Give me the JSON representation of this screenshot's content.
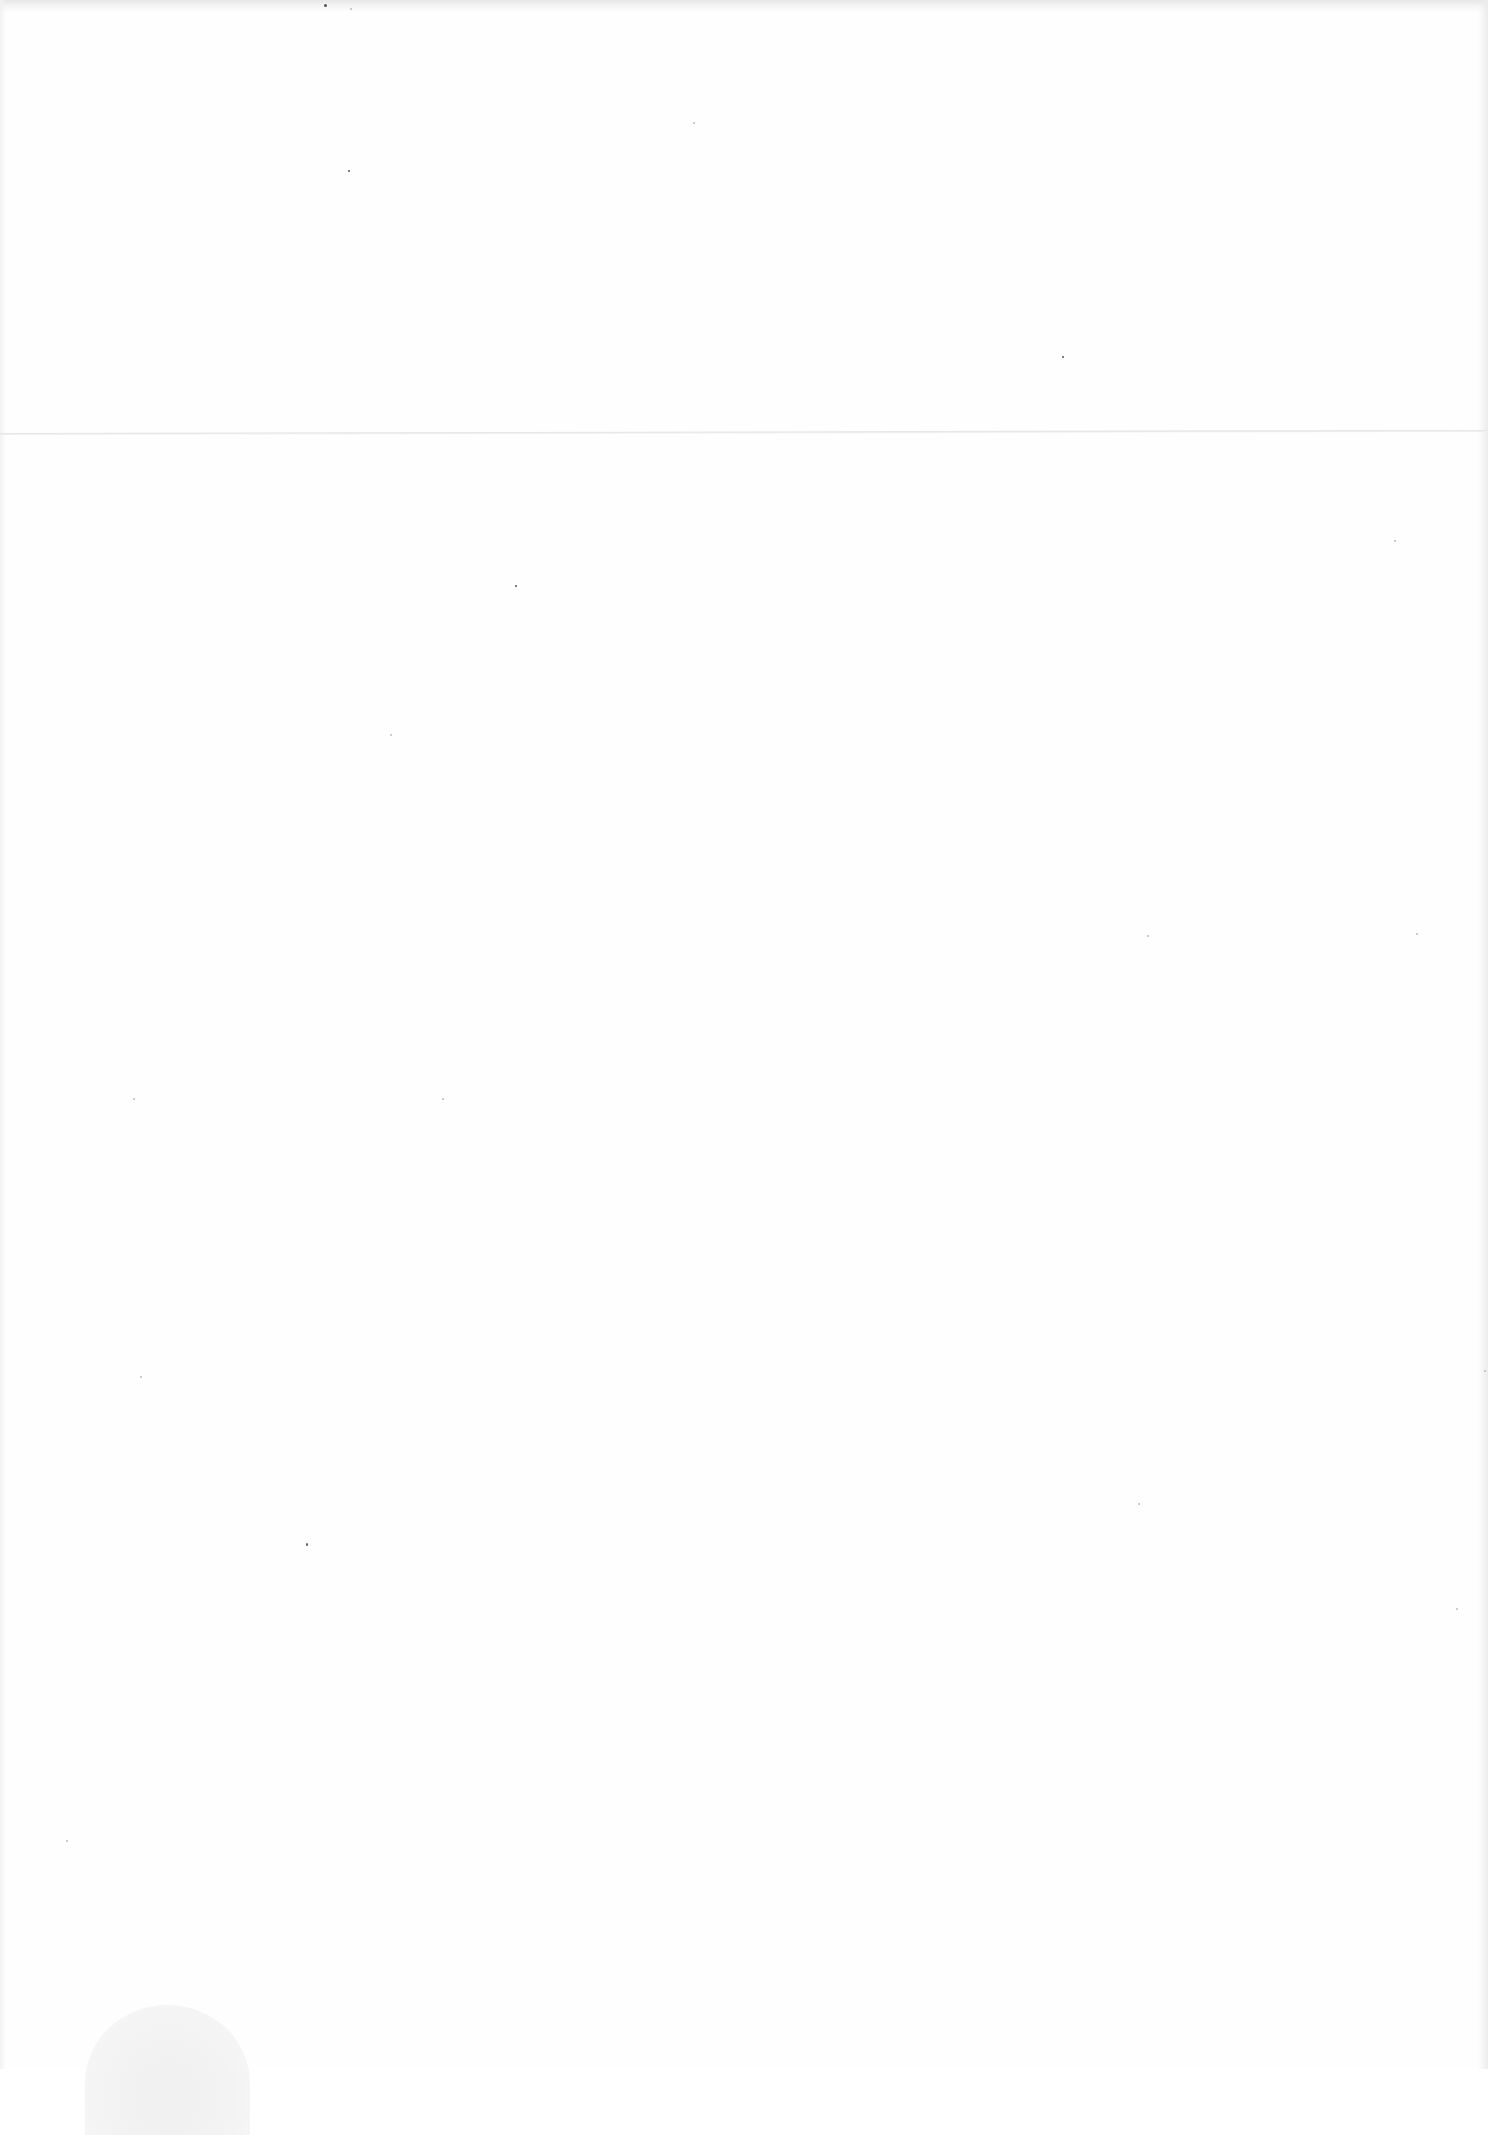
{
  "document": {
    "type": "blank scanned page",
    "text": "",
    "artifacts": {
      "fold_line": {
        "y": 433,
        "color": "#e3e3e3"
      },
      "stain": {
        "position": "bottom-left",
        "color": "#f0f0f0"
      },
      "speck_color": "#555555"
    }
  }
}
